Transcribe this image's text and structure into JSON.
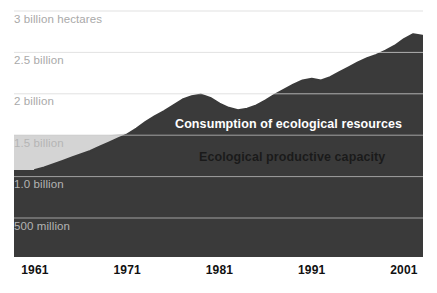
{
  "chart_data": {
    "type": "area",
    "title": "",
    "subtitle": "",
    "xlabel": "",
    "ylabel": "",
    "grid": true,
    "legend_position": "inline-on-plot",
    "xlim": [
      1961,
      2003
    ],
    "ylim": [
      0,
      3.1
    ],
    "y_unit": "billion hectares",
    "x_ticks": [
      1961,
      1971,
      1981,
      1991,
      2001
    ],
    "x_tick_labels": [
      "1961",
      "1971",
      "1981",
      "1991",
      "2001"
    ],
    "y_ticks": [
      0.5,
      1.0,
      1.5,
      2.0,
      2.5,
      3.0
    ],
    "y_tick_labels": [
      "500 million",
      "1.0 billion",
      "1.5 billion",
      "2 billion",
      "2.5 billion",
      "3 billion hectares"
    ],
    "series": [
      {
        "name": "Ecological productive capacity",
        "color": "#d4d4d4",
        "label_color": "#1a1a1a",
        "x": [
          1961,
          1962,
          1963,
          1964,
          1965,
          1966,
          1967,
          1968,
          1969,
          1970,
          1971,
          1972,
          1973,
          1974,
          1975,
          1976,
          1977,
          1978,
          1979,
          1980,
          1981,
          1982,
          1983,
          1984,
          1985,
          1986,
          1987,
          1988,
          1989,
          1990,
          1991,
          1992,
          1993,
          1994,
          1995,
          1996,
          1997,
          1998,
          1999,
          2000,
          2001,
          2002,
          2003
        ],
        "values": [
          1.5,
          1.5,
          1.5,
          1.5,
          1.5,
          1.5,
          1.5,
          1.5,
          1.5,
          1.51,
          1.52,
          1.48,
          1.51,
          1.53,
          1.49,
          1.52,
          1.54,
          1.5,
          1.52,
          1.54,
          1.5,
          1.53,
          1.49,
          1.52,
          1.55,
          1.51,
          1.54,
          1.5,
          1.53,
          1.55,
          1.51,
          1.54,
          1.5,
          1.53,
          1.56,
          1.52,
          1.55,
          1.51,
          1.54,
          1.56,
          1.52,
          1.55,
          1.54
        ]
      },
      {
        "name": "Consumption of ecological resources",
        "color": "#3a3a3a",
        "label_color": "#ffffff",
        "x": [
          1961,
          1962,
          1963,
          1964,
          1965,
          1966,
          1967,
          1968,
          1969,
          1970,
          1971,
          1972,
          1973,
          1974,
          1975,
          1976,
          1977,
          1978,
          1979,
          1980,
          1981,
          1982,
          1983,
          1984,
          1985,
          1986,
          1987,
          1988,
          1989,
          1990,
          1991,
          1992,
          1993,
          1994,
          1995,
          1996,
          1997,
          1998,
          1999,
          2000,
          2001,
          2002,
          2003
        ],
        "values": [
          1.08,
          1.11,
          1.15,
          1.19,
          1.23,
          1.27,
          1.31,
          1.36,
          1.41,
          1.46,
          1.51,
          1.58,
          1.66,
          1.73,
          1.79,
          1.86,
          1.93,
          1.97,
          1.99,
          1.95,
          1.88,
          1.83,
          1.8,
          1.82,
          1.86,
          1.92,
          1.99,
          2.05,
          2.11,
          2.16,
          2.18,
          2.16,
          2.2,
          2.26,
          2.32,
          2.38,
          2.43,
          2.47,
          2.52,
          2.58,
          2.66,
          2.72,
          2.7
        ]
      }
    ],
    "annotations": [
      {
        "text": "Consumption of ecological resources",
        "x": 1978,
        "y": 1.72,
        "color": "#ffffff"
      },
      {
        "text": "Ecological productive capacity",
        "x": 1981,
        "y": 1.32,
        "color": "#1a1a1a"
      }
    ]
  },
  "axes": {
    "y_labels": [
      {
        "text": "3 billion hectares",
        "value": 3.0,
        "muted": false
      },
      {
        "text": "2.5 billion",
        "value": 2.5,
        "muted": false
      },
      {
        "text": "2 billion",
        "value": 2.0,
        "muted": false
      },
      {
        "text": "1.5 billion",
        "value": 1.5,
        "muted": true
      },
      {
        "text": "1.0 billion",
        "value": 1.0,
        "muted": true
      },
      {
        "text": "500 million",
        "value": 0.5,
        "muted": true
      }
    ],
    "x_labels": [
      {
        "text": "1961",
        "value": 1961
      },
      {
        "text": "1971",
        "value": 1971
      },
      {
        "text": "1981",
        "value": 1981
      },
      {
        "text": "1991",
        "value": 1991
      },
      {
        "text": "2001",
        "value": 2001
      }
    ]
  },
  "labels": {
    "consumption": "Consumption of ecological resources",
    "capacity": "Ecological productive capacity"
  },
  "colors": {
    "background": "#ffffff",
    "capacity_fill": "#d4d4d4",
    "consumption_fill": "#3a3a3a",
    "gridline": "#d9d9d9",
    "gridline_on_gray": "#c4c4c4",
    "y_label_text": "#a9a9a9",
    "x_label_text": "#111111"
  }
}
